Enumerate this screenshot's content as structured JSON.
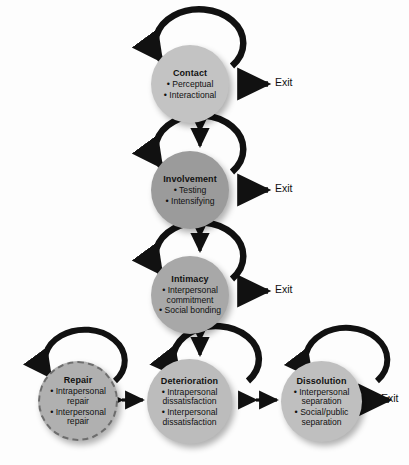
{
  "diagram": {
    "background_color": "#fdfdfd",
    "line_color": "#111111",
    "exit_label": "Exit",
    "stages": [
      {
        "id": "contact",
        "title": "Contact",
        "items": [
          "Perceptual",
          "Interactional"
        ],
        "fill": "#c3c3c3",
        "border": "solid",
        "exit": true,
        "repeat_loop": true
      },
      {
        "id": "involvement",
        "title": "Involvement",
        "items": [
          "Testing",
          "Intensifying"
        ],
        "fill": "#9b9b9b",
        "border": "solid",
        "exit": true,
        "repeat_loop": true
      },
      {
        "id": "intimacy",
        "title": "Intimacy",
        "items": [
          "Interpersonal\ncommitment",
          "Social bonding"
        ],
        "fill": "#a8a8a8",
        "border": "solid",
        "exit": true,
        "repeat_loop": true
      },
      {
        "id": "repair",
        "title": "Repair",
        "items": [
          "Intrapersonal\nrepair",
          "Interpersonal\nrepair"
        ],
        "fill": "#b0b0b0",
        "border": "dashed",
        "exit": false,
        "repeat_loop": true
      },
      {
        "id": "deterioration",
        "title": "Deterioration",
        "items": [
          "Intrapersonal\ndissatisfaction",
          "Interpersonal\ndissatisfaction"
        ],
        "fill": "#bcbcbc",
        "border": "solid",
        "exit": false,
        "repeat_loop": true
      },
      {
        "id": "dissolution",
        "title": "Dissolution",
        "items": [
          "Interpersonal\nseparation",
          "Social/public\nseparation"
        ],
        "fill": "#bfbfbf",
        "border": "solid",
        "exit": true,
        "repeat_loop": true
      }
    ],
    "exits": [
      {
        "for": "contact",
        "label": "Exit"
      },
      {
        "for": "involvement",
        "label": "Exit"
      },
      {
        "for": "intimacy",
        "label": "Exit"
      },
      {
        "for": "dissolution",
        "label": "Exit"
      }
    ],
    "connections": [
      {
        "from": "contact",
        "to": "involvement",
        "type": "double-arrow",
        "orientation": "vertical"
      },
      {
        "from": "involvement",
        "to": "intimacy",
        "type": "double-arrow",
        "orientation": "vertical"
      },
      {
        "from": "intimacy",
        "to": "deterioration",
        "type": "double-arrow",
        "orientation": "vertical"
      },
      {
        "from": "repair",
        "to": "deterioration",
        "type": "double-arrow",
        "orientation": "horizontal"
      },
      {
        "from": "deterioration",
        "to": "dissolution",
        "type": "double-arrow",
        "orientation": "horizontal"
      }
    ]
  }
}
